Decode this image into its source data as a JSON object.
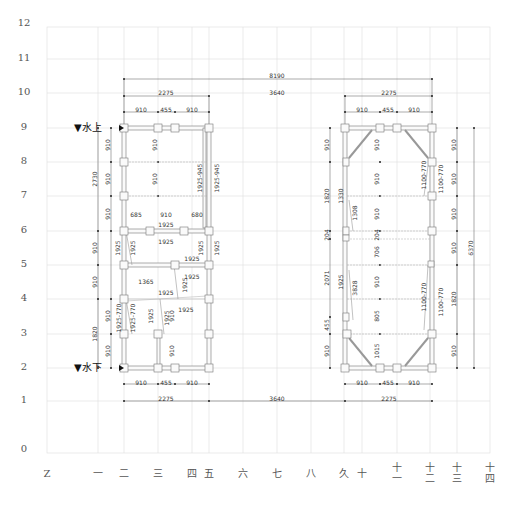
{
  "drawing": {
    "y_axis_labels": [
      {
        "label": "12",
        "y": 24
      },
      {
        "label": "11",
        "y": 59
      },
      {
        "label": "10",
        "y": 93
      },
      {
        "label": "9",
        "y": 128
      },
      {
        "label": "8",
        "y": 162
      },
      {
        "label": "7",
        "y": 196
      },
      {
        "label": "6",
        "y": 231
      },
      {
        "label": "5",
        "y": 265
      },
      {
        "label": "4",
        "y": 299
      },
      {
        "label": "3",
        "y": 334
      },
      {
        "label": "2",
        "y": 368
      },
      {
        "label": "1",
        "y": 401
      },
      {
        "label": "0",
        "y": 450
      }
    ],
    "x_axis_labels": [
      {
        "label": "Z",
        "x": 47
      },
      {
        "label": "一",
        "x": 98
      },
      {
        "label": "二",
        "x": 124
      },
      {
        "label": "三",
        "x": 158
      },
      {
        "label": "四",
        "x": 192
      },
      {
        "label": "五",
        "x": 209
      },
      {
        "label": "六",
        "x": 243
      },
      {
        "label": "七",
        "x": 277
      },
      {
        "label": "八",
        "x": 311
      },
      {
        "label": "久",
        "x": 344
      },
      {
        "label": "十",
        "x": 362
      },
      {
        "label": "十一",
        "x": 397
      },
      {
        "label": "十二",
        "x": 430
      },
      {
        "label": "十三",
        "x": 457
      },
      {
        "label": "十四",
        "x": 490
      }
    ],
    "markers": {
      "upstream": "▼水上",
      "downstream": "▼水下"
    },
    "top_dimensions": {
      "overall": "8190",
      "middle_gap": "3640",
      "left_span": "2275",
      "right_span": "2275",
      "left_sub": [
        "910",
        "455",
        "910"
      ],
      "right_sub": [
        "910",
        "455",
        "910"
      ]
    },
    "bottom_dimensions": {
      "middle_gap": "3640",
      "left_span": "2275",
      "right_span": "2275",
      "left_sub": [
        "910",
        "455",
        "910"
      ],
      "right_sub": [
        "910",
        "455",
        "910"
      ]
    },
    "left_structure": {
      "outer_left_dims": [
        "2730",
        "910",
        "910",
        "1820"
      ],
      "inner_left_dims": [
        "910",
        "910",
        "910",
        "910",
        "910"
      ],
      "center_dims": [
        "910",
        "910",
        "910",
        "910"
      ],
      "row6_sub": [
        "685",
        "910",
        "680"
      ],
      "diagonal_labels": [
        "1925-945",
        "1925-945",
        "1925",
        "1925",
        "1925",
        "1925",
        "1925",
        "1925",
        "1925",
        "1365",
        "1925",
        "1925",
        "1925",
        "1925",
        "1925-770",
        "1925-770",
        "1925",
        "1925",
        "1925"
      ]
    },
    "right_structure": {
      "left_dims": [
        "910",
        "1820",
        "204",
        "2071",
        "455",
        "910"
      ],
      "inner_left_dims": [
        "1330",
        "1308",
        "1925",
        "3828"
      ],
      "center_dims": [
        "910",
        "910",
        "910",
        "204",
        "706",
        "910",
        "805",
        "1015"
      ],
      "right_dims": [
        "910",
        "910",
        "910",
        "910",
        "1820",
        "910"
      ],
      "overall_right": "6370",
      "diagonal_labels": [
        "1100-770",
        "1100-770",
        "1100-770",
        "1100-770"
      ]
    }
  }
}
